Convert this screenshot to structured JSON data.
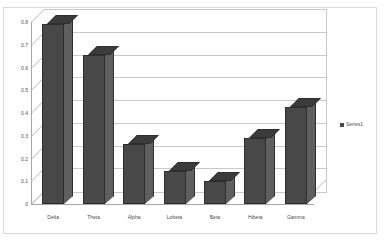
{
  "chart_data": {
    "type": "bar",
    "title": "",
    "subtitle": "",
    "xlabel": "",
    "ylabel": "",
    "categories": [
      "Delta",
      "Theta",
      "Alpha",
      "Lobeta",
      "Beta",
      "Hibeta",
      "Gamma"
    ],
    "values": [
      0.79,
      0.655,
      0.265,
      0.145,
      0.1,
      0.29,
      0.425
    ],
    "series": [
      {
        "name": "Series1",
        "values": [
          0.79,
          0.655,
          0.265,
          0.145,
          0.1,
          0.29,
          0.425
        ]
      }
    ],
    "ylim": [
      0,
      0.8
    ],
    "ytick_labels": [
      "0",
      "0.1",
      "0.2",
      "0.3",
      "0.4",
      "0.5",
      "0.6",
      "0.7",
      "0.8"
    ],
    "ytick_values": [
      0,
      0.1,
      0.2,
      0.3,
      0.4,
      0.5,
      0.6,
      0.7,
      0.8
    ],
    "grid": true,
    "grid_axis": "y",
    "legend": {
      "position": "right",
      "entries": [
        "Series1"
      ]
    },
    "style": "3d-column",
    "colors": {
      "bar_front": "#484848",
      "bar_side": "#5f5f5f",
      "bar_top": "#3b3b3b",
      "bar_outline": "#2e2e2e",
      "gridline": "#c9c9c9",
      "axis": "#a6a6a6",
      "plot_background": "#ffffff",
      "frame_border": "#d9d9d9",
      "text": "#4d4d4d"
    }
  }
}
